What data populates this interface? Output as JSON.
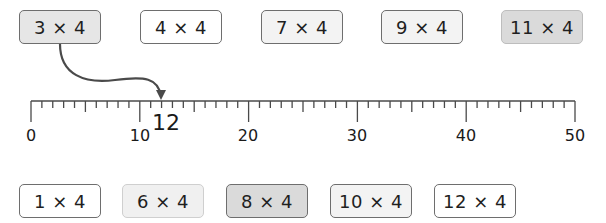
{
  "top_cards": [
    {
      "label": "3 × 4",
      "shade": "mid"
    },
    {
      "label": "4 × 4",
      "shade": "white"
    },
    {
      "label": "7 × 4",
      "shade": "light"
    },
    {
      "label": "9 × 4",
      "shade": "light"
    },
    {
      "label": "11 × 4",
      "shade": "dark"
    }
  ],
  "bottom_cards": [
    {
      "label": "1 × 4",
      "shade": "white"
    },
    {
      "label": "6 × 4",
      "shade": "pale"
    },
    {
      "label": "8 × 4",
      "shade": "dark"
    },
    {
      "label": "10 × 4",
      "shade": "light"
    },
    {
      "label": "12 × 4",
      "shade": "white"
    }
  ],
  "number_line": {
    "min": 0,
    "max": 50,
    "major_step": 10,
    "minor_step": 1,
    "labels": [
      "0",
      "10",
      "20",
      "30",
      "40",
      "50"
    ],
    "marked_value": "12",
    "arrow_from": "3 × 4",
    "arrow_to": 12
  },
  "colors": {
    "line": "#4a4a4a",
    "card_border": "#6e6e6e",
    "text": "#1a1a1a"
  }
}
